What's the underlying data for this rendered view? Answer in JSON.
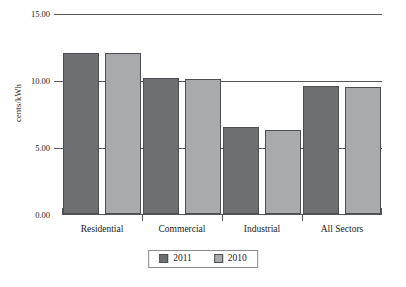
{
  "chart_data": {
    "type": "bar",
    "title": "",
    "xlabel": "",
    "ylabel": "cents/kWh",
    "categories": [
      "Residential",
      "Commercial",
      "Industrial",
      "All Sectors"
    ],
    "series": [
      {
        "name": "2011",
        "color": "#6e6f72",
        "values": [
          12.05,
          10.15,
          6.5,
          9.55
        ]
      },
      {
        "name": "2010",
        "color": "#a9aaac",
        "values": [
          12.0,
          10.1,
          6.3,
          9.45
        ]
      }
    ],
    "ylim": [
      0,
      15
    ],
    "yticks": [
      "0.00",
      "5.00",
      "10.00",
      "15.00"
    ],
    "ytick_values": [
      0,
      5,
      10,
      15
    ],
    "grid": true,
    "legend_position": "bottom-center"
  },
  "legend": {
    "entries": [
      {
        "label": "2011",
        "color": "#6e6f72"
      },
      {
        "label": "2010",
        "color": "#a9aaac"
      }
    ]
  },
  "axis": {
    "y_title": "cents/kWh"
  }
}
